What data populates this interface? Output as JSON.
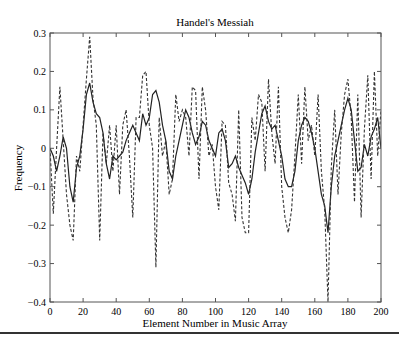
{
  "chart_data": {
    "type": "line",
    "title": "Handel's Messiah",
    "xlabel": "Element Number in Music Array",
    "ylabel": "Frequency",
    "xlim": [
      0,
      200
    ],
    "ylim": [
      -0.4,
      0.3
    ],
    "xticks": [
      0,
      20,
      40,
      60,
      80,
      100,
      120,
      140,
      160,
      180,
      200
    ],
    "yticks": [
      -0.4,
      -0.3,
      -0.2,
      -0.1,
      0,
      0.1,
      0.2,
      0.3
    ],
    "ytick_labels": [
      "−0.4",
      "−0.3",
      "−0.2",
      "−0.1",
      "0",
      "0.1",
      "0.2",
      "0.3"
    ],
    "grid": false,
    "legend": null,
    "x": [
      0,
      2,
      4,
      6,
      8,
      10,
      12,
      14,
      16,
      18,
      20,
      22,
      24,
      26,
      28,
      30,
      32,
      34,
      36,
      38,
      40,
      42,
      44,
      46,
      48,
      50,
      52,
      54,
      56,
      58,
      60,
      62,
      64,
      66,
      68,
      70,
      72,
      74,
      76,
      78,
      80,
      82,
      84,
      86,
      88,
      90,
      92,
      94,
      96,
      98,
      100,
      102,
      104,
      106,
      108,
      110,
      112,
      114,
      116,
      118,
      120,
      122,
      124,
      126,
      128,
      130,
      132,
      134,
      136,
      138,
      140,
      142,
      144,
      146,
      148,
      150,
      152,
      154,
      156,
      158,
      160,
      162,
      164,
      166,
      168,
      170,
      172,
      174,
      176,
      178,
      180,
      182,
      184,
      186,
      188,
      190,
      192,
      194,
      196,
      198,
      200
    ],
    "series": [
      {
        "name": "solid",
        "style": "solid",
        "color": "#222222",
        "values": [
          0.0,
          -0.02,
          -0.06,
          -0.02,
          0.03,
          0.0,
          -0.1,
          -0.14,
          -0.05,
          -0.02,
          0.05,
          0.14,
          0.17,
          0.12,
          0.09,
          0.08,
          0.04,
          -0.04,
          -0.08,
          -0.02,
          -0.03,
          -0.02,
          -0.01,
          0.02,
          0.04,
          0.06,
          0.04,
          0.02,
          0.09,
          0.06,
          0.08,
          0.14,
          0.15,
          0.12,
          0.06,
          0.02,
          -0.06,
          -0.08,
          -0.02,
          0.02,
          0.06,
          0.1,
          0.08,
          0.04,
          0.01,
          0.03,
          0.07,
          0.06,
          0.02,
          0.0,
          -0.02,
          0.04,
          0.05,
          0.02,
          -0.05,
          -0.04,
          -0.02,
          -0.05,
          -0.07,
          -0.09,
          -0.12,
          -0.08,
          -0.01,
          0.04,
          0.09,
          0.11,
          0.07,
          0.05,
          0.06,
          0.02,
          -0.02,
          -0.08,
          -0.1,
          -0.1,
          -0.06,
          0.02,
          0.06,
          0.08,
          0.07,
          0.04,
          0.0,
          -0.06,
          -0.12,
          -0.15,
          -0.22,
          -0.1,
          -0.02,
          0.02,
          0.06,
          0.1,
          0.13,
          0.1,
          0.02,
          -0.06,
          -0.05,
          0.01,
          -0.02,
          0.03,
          0.05,
          0.08,
          0.0
        ]
      },
      {
        "name": "dashed",
        "style": "dashed",
        "color": "#333333",
        "values": [
          0.0,
          -0.17,
          0.0,
          0.16,
          0.02,
          -0.12,
          -0.2,
          -0.24,
          -0.02,
          -0.06,
          0.06,
          0.18,
          0.29,
          0.13,
          0.06,
          -0.24,
          0.04,
          -0.04,
          0.06,
          -0.06,
          0.06,
          -0.12,
          0.06,
          0.1,
          -0.02,
          -0.18,
          0.08,
          0.08,
          0.19,
          0.2,
          0.06,
          0.0,
          -0.31,
          0.08,
          -0.02,
          0.02,
          -0.12,
          -0.08,
          0.14,
          0.07,
          0.1,
          0.08,
          -0.02,
          0.16,
          0.15,
          -0.08,
          0.16,
          0.1,
          -0.02,
          0.01,
          -0.1,
          -0.16,
          0.07,
          0.06,
          -0.09,
          -0.12,
          -0.19,
          0.1,
          -0.18,
          -0.22,
          -0.22,
          0.08,
          0.02,
          0.14,
          0.12,
          -0.06,
          0.18,
          0.04,
          -0.04,
          0.16,
          -0.1,
          -0.18,
          -0.22,
          -0.16,
          -0.02,
          0.14,
          -0.04,
          0.16,
          0.02,
          0.06,
          -0.02,
          0.14,
          -0.06,
          -0.16,
          -0.4,
          -0.05,
          0.1,
          -0.12,
          0.04,
          0.14,
          0.18,
          0.08,
          -0.14,
          0.14,
          -0.18,
          0.05,
          0.19,
          -0.08,
          0.2,
          -0.02,
          0.1
        ]
      }
    ]
  }
}
